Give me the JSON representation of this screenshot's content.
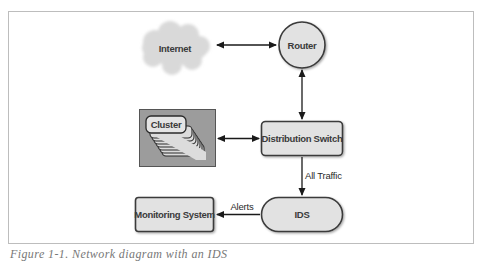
{
  "figure": {
    "caption": "Figure 1-1. Network diagram with an IDS",
    "colors": {
      "frame_border": "#bdbdbd",
      "node_fill": "#e2e2e2",
      "node_stroke": "#3a3a3a",
      "cloud_fill": "#d9d9d9",
      "cluster_panel_fill": "#9c9c9c",
      "arrow": "#1a1a1a",
      "text": "#333333"
    }
  },
  "nodes": {
    "internet": {
      "label": "Internet",
      "shape": "cloud"
    },
    "router": {
      "label": "Router",
      "shape": "circle"
    },
    "cluster": {
      "label": "Cluster",
      "shape": "stacked-rounded-rects"
    },
    "distribution_switch": {
      "label": "Distribution Switch",
      "shape": "rounded-rect"
    },
    "ids": {
      "label": "IDS",
      "shape": "pill"
    },
    "monitoring_system": {
      "label": "Monitoring System",
      "shape": "rounded-rect"
    }
  },
  "edges": [
    {
      "from": "Internet",
      "to": "Router",
      "direction": "bidirectional",
      "label": ""
    },
    {
      "from": "Router",
      "to": "Distribution Switch",
      "direction": "bidirectional",
      "label": ""
    },
    {
      "from": "Cluster",
      "to": "Distribution Switch",
      "direction": "bidirectional",
      "label": ""
    },
    {
      "from": "Distribution Switch",
      "to": "IDS",
      "direction": "forward",
      "label": "All Traffic"
    },
    {
      "from": "IDS",
      "to": "Monitoring System",
      "direction": "forward",
      "label": "Alerts"
    }
  ],
  "edge_labels": {
    "all_traffic": "All Traffic",
    "alerts": "Alerts"
  }
}
